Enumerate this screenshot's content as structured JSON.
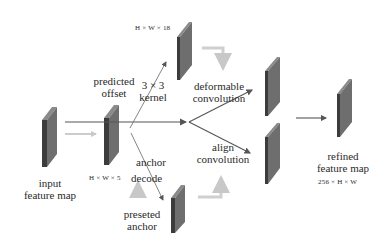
{
  "diagram": {
    "nodes": {
      "input": {
        "label_line1": "input",
        "label_line2": "feature map"
      },
      "offset": {
        "label_line1": "predicted",
        "label_line2": "offset",
        "dims": "H × W × 18"
      },
      "anchor_decode": {
        "dims": "H × W × 5",
        "label_line1": "anchor",
        "label_line2": "decode"
      },
      "preseted_anchor": {
        "label_line1": "preseted",
        "label_line2": "anchor"
      },
      "kernel": {
        "label_line1": "3 × 3",
        "label_line2": "kernel"
      },
      "deformable": {
        "label_line1": "deformable",
        "label_line2": "convolution"
      },
      "align": {
        "label_line1": "align",
        "label_line2": "convolution"
      },
      "refined": {
        "label_line1": "refined",
        "label_line2": "feature map",
        "dims": "256 × H × W"
      }
    },
    "colors": {
      "slab_front": "#6e6e6e",
      "slab_side": "#3c3c3c",
      "slab_top": "#8a8a8a",
      "arrow": "#555555",
      "arrow_light": "#c8c8c8"
    }
  }
}
